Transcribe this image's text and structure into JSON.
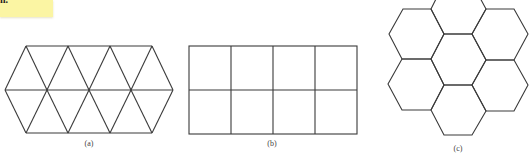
{
  "highlight": {
    "text": "n.",
    "color": "#fbf5a3"
  },
  "figures": [
    {
      "id": "a",
      "caption": "(a)",
      "shape": "triangular tiling",
      "rows": 2,
      "triangles": 14
    },
    {
      "id": "b",
      "caption": "(b)",
      "shape": "square tiling",
      "rows": 2,
      "columns": 4
    },
    {
      "id": "c",
      "caption": "(c)",
      "shape": "hexagonal tiling",
      "hexagons": 7
    }
  ],
  "line_color": "#3a3a3a"
}
